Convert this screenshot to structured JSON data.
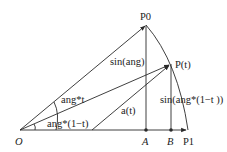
{
  "diagram": {
    "points": {
      "origin": "O",
      "p0": "P0",
      "pt": "P(t)",
      "a": "A",
      "b": "B",
      "p1": "P1"
    },
    "labels": {
      "sin_ang": "sin(ang)",
      "ang_t": "ang*t",
      "ang_1mt": "ang*(1−t)",
      "a_t": "a(t)",
      "sin_ang_1mt": "sin(ang*(1−t ))"
    },
    "colors": {
      "stroke": "#2a2a2a",
      "text": "#222222",
      "background": "#ffffff"
    }
  }
}
